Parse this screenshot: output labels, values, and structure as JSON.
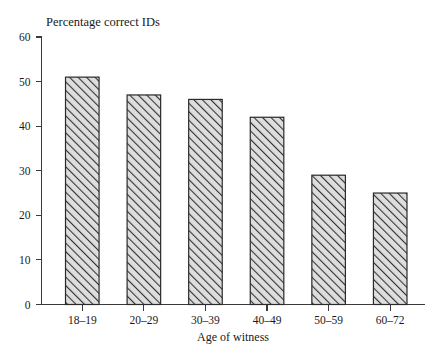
{
  "chart_data": {
    "type": "bar",
    "title": "Percentage correct IDs",
    "xlabel": "Age of witness",
    "ylabel": "",
    "categories": [
      "18–19",
      "20–29",
      "30–39",
      "40–49",
      "50–59",
      "60–72"
    ],
    "values": [
      51,
      47,
      46,
      42,
      29,
      25
    ],
    "ylim": [
      0,
      60
    ],
    "ytick_labels": [
      "0",
      "10",
      "20",
      "30",
      "40",
      "50",
      "60"
    ],
    "ytick_values": [
      0,
      10,
      20,
      30,
      40,
      50,
      60
    ],
    "grid": false,
    "legend": null,
    "bar_style": {
      "fill": "#d8d8d8",
      "edge_color": "#2a2a2a",
      "hatch": "diagonal-forward-slash"
    },
    "axis_color": "#3a3a3a",
    "background": "#ffffff"
  },
  "meta": {
    "title_position": "top-left-of-plot",
    "xlabel_position": "below-axis-centered",
    "tick_direction": "outward"
  }
}
